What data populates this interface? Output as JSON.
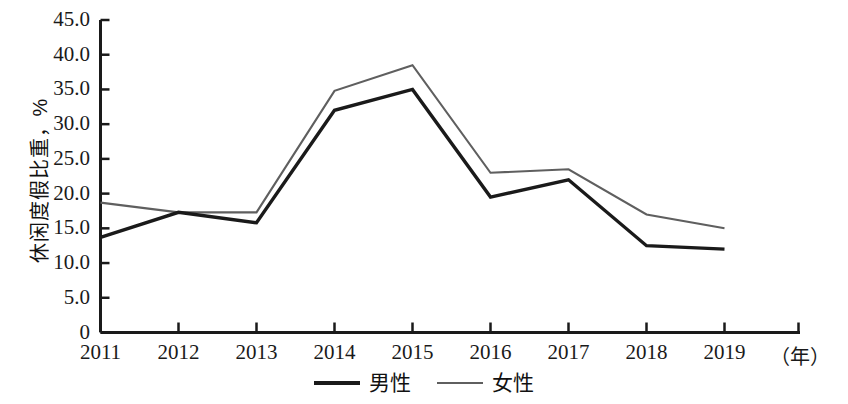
{
  "chart_data": {
    "type": "line",
    "title": "",
    "xlabel": "（年）",
    "ylabel": "休闲度假比重，%",
    "x": [
      "2011",
      "2012",
      "2013",
      "2014",
      "2015",
      "2016",
      "2017",
      "2018",
      "2019"
    ],
    "categories": [
      "2011",
      "2012",
      "2013",
      "2014",
      "2015",
      "2016",
      "2017",
      "2018",
      "2019"
    ],
    "series": [
      {
        "name": "男性",
        "color": "#1a1a1a",
        "values": [
          13.7,
          17.3,
          15.8,
          32.0,
          35.0,
          19.5,
          22.0,
          12.5,
          12.0
        ]
      },
      {
        "name": "女性",
        "color": "#5f5f5f",
        "values": [
          18.7,
          17.3,
          17.3,
          34.8,
          38.5,
          23.0,
          23.5,
          17.0,
          15.0
        ]
      }
    ],
    "ylim": [
      0,
      45
    ],
    "yticks": [
      0,
      5,
      10,
      15,
      20,
      25,
      30,
      35,
      40,
      45
    ],
    "ytick_labels": [
      "0",
      "5.0",
      "10.0",
      "15.0",
      "20.0",
      "25.0",
      "30.0",
      "35.0",
      "40.0",
      "45.0"
    ],
    "grid": false,
    "legend_position": "bottom"
  },
  "legend": {
    "items": [
      {
        "label": "男性"
      },
      {
        "label": "女性"
      }
    ]
  },
  "axes": {
    "y_title": "休闲度假比重，%",
    "x_unit": "（年）"
  }
}
